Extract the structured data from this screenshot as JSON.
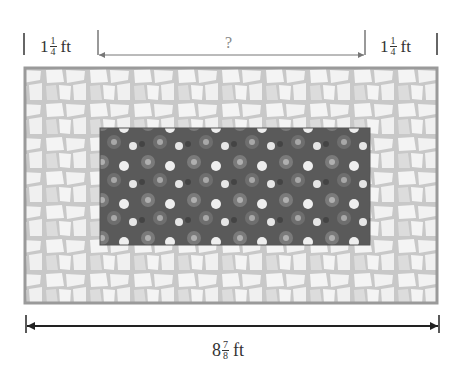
{
  "diagram": {
    "type": "flower-bed-with-border",
    "left_border": {
      "whole": "1",
      "num": "1",
      "den": "4",
      "unit": "ft"
    },
    "right_border": {
      "whole": "1",
      "num": "1",
      "den": "4",
      "unit": "ft"
    },
    "inner_width": {
      "label": "?"
    },
    "total_width": {
      "whole": "8",
      "num": "7",
      "den": "8",
      "unit": "ft"
    },
    "colors": {
      "border_frame": "#9a9a9a",
      "stone": "#f4f4f4",
      "grout": "#c8c8c8",
      "stone_shaded": "#dcdcdc",
      "bed": "#5a5a5a",
      "flower": "#b0b0b0",
      "flower_bright": "#eeeeee",
      "dimension_line": "#222222",
      "question_line": "#777777"
    }
  }
}
